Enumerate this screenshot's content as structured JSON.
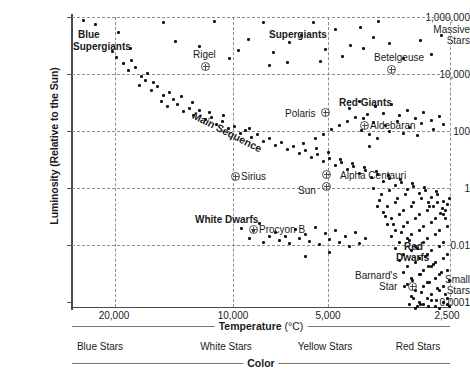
{
  "chart_data": {
    "type": "scatter",
    "xlabel": "Temperature",
    "xunit": "(°C)",
    "ylabel": "Luminosity (Relative to the Sun)",
    "x_axis_reversed": true,
    "x_scale": "log-reversed",
    "y_scale": "log",
    "xlim": [
      30000,
      2300
    ],
    "ylim": [
      0.0001,
      1000000
    ],
    "grid": true,
    "legend": "none",
    "xticks": [
      {
        "label": "20,000",
        "value": 20000
      },
      {
        "label": "10,000",
        "value": 10000
      },
      {
        "label": "5,000",
        "value": 5000
      },
      {
        "label": "2,500",
        "value": 2500
      }
    ],
    "yticks": [
      {
        "label": "1,000,000",
        "value": 1000000
      },
      {
        "label": "10,000",
        "value": 10000
      },
      {
        "label": "100",
        "value": 100
      },
      {
        "label": "1",
        "value": 1
      },
      {
        "label": "0.01",
        "value": 0.01
      },
      {
        "label": "0.0001",
        "value": 0.0001
      }
    ],
    "y_end_notes": [
      {
        "label": "Massive Stars",
        "position": "top"
      },
      {
        "label": "Small Stars",
        "position": "bottom"
      }
    ],
    "color_axis": {
      "title": "Color",
      "categories": [
        "Blue Stars",
        "White Stars",
        "Yellow Stars",
        "Red Stars"
      ]
    },
    "region_labels": [
      {
        "name": "Blue Supergiants",
        "text": "Blue\nSupergiants",
        "bold": true
      },
      {
        "name": "Supergiants",
        "text": "Supergiants",
        "bold": true
      },
      {
        "name": "Red Giants",
        "text": "Red Giants",
        "bold": true
      },
      {
        "name": "Main Sequence",
        "text": "Main Sequence",
        "bold": true,
        "rotated": true
      },
      {
        "name": "White Dwarfs",
        "text": "White Dwarfs",
        "bold": true
      },
      {
        "name": "Red Dwarfs",
        "text": "Red\nDwarfs",
        "bold": true
      }
    ],
    "named_stars": [
      {
        "name": "Rigel",
        "label": "Rigel"
      },
      {
        "name": "Betelgeuse",
        "label": "Betelgeuse"
      },
      {
        "name": "Polaris",
        "label": "Polaris"
      },
      {
        "name": "Aldebaran",
        "label": "Aldebaran"
      },
      {
        "name": "Sirius",
        "label": "Sirius"
      },
      {
        "name": "Alpha Centauri",
        "label": "Alpha Centauri"
      },
      {
        "name": "Sun",
        "label": "Sun"
      },
      {
        "name": "Procyon B",
        "label": "Procyon B"
      },
      {
        "name": "Barnard's Star",
        "label": "Barnard's\nStar"
      }
    ]
  },
  "axes": {
    "y_title": "Luminosity (Relative to the Sun)",
    "y_ticks": [
      {
        "text": "1,000,000",
        "top": 12
      },
      {
        "text": "Massive",
        "top": 24
      },
      {
        "text": "Stars",
        "top": 35
      },
      {
        "text": "10,000",
        "top": 69
      },
      {
        "text": "100",
        "top": 126
      },
      {
        "text": "1",
        "top": 183
      },
      {
        "text": "0.01",
        "top": 240
      },
      {
        "text": "Small",
        "top": 274
      },
      {
        "text": "Stars",
        "top": 285
      },
      {
        "text": "0.0001",
        "top": 297
      }
    ],
    "x_ticks": [
      {
        "text": "20,000",
        "x": 114
      },
      {
        "text": "10,000",
        "x": 233
      },
      {
        "text": "5,000",
        "x": 328
      },
      {
        "text": "2,500",
        "x": 447
      }
    ],
    "x_title_main": "Temperature",
    "x_title_unit": "(°C)",
    "color_title": "Color",
    "color_cats": [
      {
        "text": "Blue Stars",
        "x": 100
      },
      {
        "text": "White Stars",
        "x": 226
      },
      {
        "text": "Yellow Stars",
        "x": 325
      },
      {
        "text": "Red Stars",
        "x": 418
      }
    ]
  },
  "regions": {
    "blue_supergiants": "Blue",
    "blue_supergiants2": "Supergiants",
    "supergiants": "Supergiants",
    "red_giants": "Red Giants",
    "main_sequence": "Main Sequence",
    "white_dwarfs": "White Dwarfs",
    "red_dwarfs": "Red",
    "red_dwarfs2": "Dwarfs"
  },
  "stars": {
    "rigel": "Rigel",
    "betelgeuse": "Betelgeuse",
    "polaris": "Polaris",
    "aldebaran": "Aldebaran",
    "sirius": "Sirius",
    "alpha_centauri": "Alpha Centauri",
    "sun": "Sun",
    "procyon_b": "Procyon B",
    "barnards": "Barnard's",
    "barnards2": "Star"
  },
  "grid": {
    "v": [
      43,
      161,
      256,
      378
    ],
    "h": [
      0,
      57,
      114,
      171,
      228
    ]
  },
  "points": [
    [
      10,
      2
    ],
    [
      22,
      6
    ],
    [
      39,
      33
    ],
    [
      45,
      14
    ],
    [
      57,
      30
    ],
    [
      90,
      4
    ],
    [
      102,
      23
    ],
    [
      126,
      28
    ],
    [
      141,
      3
    ],
    [
      156,
      40
    ],
    [
      165,
      32
    ],
    [
      175,
      21
    ],
    [
      190,
      4
    ],
    [
      200,
      34
    ],
    [
      216,
      24
    ],
    [
      228,
      17
    ],
    [
      240,
      4
    ],
    [
      252,
      31
    ],
    [
      262,
      11
    ],
    [
      277,
      27
    ],
    [
      290,
      30
    ],
    [
      300,
      19
    ],
    [
      316,
      25
    ],
    [
      330,
      40
    ],
    [
      347,
      22
    ],
    [
      358,
      36
    ],
    [
      368,
      17
    ],
    [
      305,
      3
    ],
    [
      287,
      9
    ],
    [
      269,
      38
    ],
    [
      247,
      43
    ],
    [
      214,
      44
    ],
    [
      196,
      47
    ],
    [
      43,
      39
    ],
    [
      50,
      45
    ],
    [
      55,
      52
    ],
    [
      62,
      49
    ],
    [
      68,
      58
    ],
    [
      74,
      55
    ],
    [
      80,
      64
    ],
    [
      58,
      42
    ],
    [
      66,
      67
    ],
    [
      72,
      62
    ],
    [
      78,
      72
    ],
    [
      84,
      68
    ],
    [
      90,
      77
    ],
    [
      96,
      74
    ],
    [
      88,
      83
    ],
    [
      94,
      88
    ],
    [
      100,
      81
    ],
    [
      104,
      86
    ],
    [
      110,
      93
    ],
    [
      116,
      90
    ],
    [
      108,
      78
    ],
    [
      120,
      97
    ],
    [
      126,
      92
    ],
    [
      132,
      101
    ],
    [
      119,
      84
    ],
    [
      138,
      99
    ],
    [
      143,
      106
    ],
    [
      149,
      103
    ],
    [
      155,
      110
    ],
    [
      136,
      94
    ],
    [
      161,
      108
    ],
    [
      150,
      97
    ],
    [
      167,
      115
    ],
    [
      172,
      112
    ],
    [
      178,
      119
    ],
    [
      184,
      116
    ],
    [
      190,
      123
    ],
    [
      196,
      120
    ],
    [
      202,
      127
    ],
    [
      176,
      110
    ],
    [
      208,
      124
    ],
    [
      214,
      131
    ],
    [
      220,
      128
    ],
    [
      226,
      135
    ],
    [
      232,
      132
    ],
    [
      238,
      139
    ],
    [
      244,
      136
    ],
    [
      250,
      143
    ],
    [
      256,
      140
    ],
    [
      262,
      147
    ],
    [
      268,
      144
    ],
    [
      274,
      151
    ],
    [
      280,
      148
    ],
    [
      286,
      155
    ],
    [
      292,
      152
    ],
    [
      298,
      159
    ],
    [
      304,
      156
    ],
    [
      310,
      163
    ],
    [
      316,
      160
    ],
    [
      322,
      167
    ],
    [
      328,
      164
    ],
    [
      334,
      171
    ],
    [
      340,
      168
    ],
    [
      346,
      175
    ],
    [
      352,
      172
    ],
    [
      358,
      179
    ],
    [
      364,
      176
    ],
    [
      370,
      183
    ],
    [
      376,
      180
    ],
    [
      230,
      125
    ],
    [
      243,
      130
    ],
    [
      255,
      134
    ],
    [
      267,
      141
    ],
    [
      279,
      145
    ],
    [
      291,
      149
    ],
    [
      303,
      153
    ],
    [
      315,
      157
    ],
    [
      327,
      161
    ],
    [
      339,
      165
    ],
    [
      351,
      169
    ],
    [
      363,
      173
    ],
    [
      369,
      190
    ],
    [
      374,
      186
    ],
    [
      367,
      195
    ],
    [
      372,
      200
    ],
    [
      360,
      188
    ],
    [
      355,
      184
    ],
    [
      640,
      90
    ],
    [
      276,
      90
    ],
    [
      286,
      83
    ],
    [
      294,
      96
    ],
    [
      302,
      88
    ],
    [
      310,
      95
    ],
    [
      318,
      86
    ],
    [
      326,
      97
    ],
    [
      334,
      92
    ],
    [
      342,
      100
    ],
    [
      350,
      94
    ],
    [
      358,
      102
    ],
    [
      366,
      98
    ],
    [
      300,
      104
    ],
    [
      312,
      107
    ],
    [
      324,
      103
    ],
    [
      336,
      109
    ],
    [
      348,
      105
    ],
    [
      360,
      111
    ],
    [
      370,
      106
    ],
    [
      290,
      100
    ],
    [
      282,
      99
    ],
    [
      274,
      103
    ],
    [
      266,
      107
    ],
    [
      258,
      111
    ],
    [
      250,
      116
    ],
    [
      242,
      120
    ],
    [
      296,
      116
    ],
    [
      304,
      120
    ],
    [
      288,
      112
    ],
    [
      316,
      113
    ],
    [
      330,
      115
    ],
    [
      344,
      117
    ],
    [
      296,
      128
    ],
    [
      186,
      205
    ],
    [
      202,
      214
    ],
    [
      212,
      218
    ],
    [
      222,
      211
    ],
    [
      232,
      216
    ],
    [
      242,
      209
    ],
    [
      252,
      215
    ],
    [
      262,
      212
    ],
    [
      272,
      218
    ],
    [
      282,
      214
    ],
    [
      292,
      220
    ],
    [
      206,
      222
    ],
    [
      216,
      225
    ],
    [
      226,
      220
    ],
    [
      236,
      223
    ],
    [
      246,
      226
    ],
    [
      256,
      221
    ],
    [
      266,
      224
    ],
    [
      276,
      228
    ],
    [
      286,
      225
    ],
    [
      196,
      218
    ],
    [
      190,
      224
    ],
    [
      180,
      212
    ],
    [
      168,
      210
    ],
    [
      176,
      220
    ],
    [
      256,
      234
    ],
    [
      232,
      238
    ],
    [
      300,
      170
    ],
    [
      308,
      176
    ],
    [
      316,
      172
    ],
    [
      324,
      180
    ],
    [
      332,
      176
    ],
    [
      340,
      184
    ],
    [
      348,
      180
    ],
    [
      356,
      188
    ],
    [
      364,
      184
    ],
    [
      372,
      192
    ],
    [
      306,
      182
    ],
    [
      314,
      188
    ],
    [
      322,
      184
    ],
    [
      330,
      192
    ],
    [
      338,
      188
    ],
    [
      346,
      196
    ],
    [
      354,
      192
    ],
    [
      362,
      200
    ],
    [
      370,
      196
    ],
    [
      310,
      194
    ],
    [
      318,
      200
    ],
    [
      326,
      196
    ],
    [
      334,
      204
    ],
    [
      342,
      200
    ],
    [
      350,
      208
    ],
    [
      358,
      204
    ],
    [
      366,
      212
    ],
    [
      374,
      208
    ],
    [
      314,
      206
    ],
    [
      322,
      212
    ],
    [
      330,
      208
    ],
    [
      338,
      216
    ],
    [
      346,
      212
    ],
    [
      354,
      220
    ],
    [
      362,
      216
    ],
    [
      370,
      224
    ],
    [
      318,
      218
    ],
    [
      326,
      224
    ],
    [
      334,
      220
    ],
    [
      342,
      228
    ],
    [
      350,
      224
    ],
    [
      358,
      232
    ],
    [
      366,
      228
    ],
    [
      374,
      236
    ],
    [
      322,
      230
    ],
    [
      330,
      236
    ],
    [
      338,
      232
    ],
    [
      346,
      240
    ],
    [
      354,
      236
    ],
    [
      362,
      244
    ],
    [
      370,
      240
    ],
    [
      326,
      242
    ],
    [
      334,
      248
    ],
    [
      342,
      244
    ],
    [
      350,
      252
    ],
    [
      358,
      248
    ],
    [
      366,
      256
    ],
    [
      374,
      252
    ],
    [
      330,
      254
    ],
    [
      338,
      260
    ],
    [
      346,
      256
    ],
    [
      354,
      264
    ],
    [
      362,
      260
    ],
    [
      370,
      268
    ],
    [
      334,
      266
    ],
    [
      342,
      272
    ],
    [
      350,
      268
    ],
    [
      358,
      276
    ],
    [
      366,
      272
    ],
    [
      374,
      280
    ],
    [
      338,
      278
    ],
    [
      346,
      284
    ],
    [
      354,
      280
    ],
    [
      362,
      288
    ],
    [
      370,
      284
    ],
    [
      342,
      290
    ],
    [
      350,
      286
    ],
    [
      358,
      282
    ],
    [
      366,
      290
    ],
    [
      374,
      286
    ],
    [
      304,
      188
    ],
    [
      312,
      198
    ],
    [
      320,
      206
    ],
    [
      328,
      214
    ],
    [
      336,
      222
    ],
    [
      344,
      230
    ],
    [
      352,
      238
    ],
    [
      360,
      246
    ],
    [
      368,
      254
    ],
    [
      376,
      262
    ],
    [
      355,
      248
    ],
    [
      347,
      256
    ],
    [
      339,
      262
    ],
    [
      331,
      268
    ],
    [
      356,
      264
    ],
    [
      364,
      270
    ],
    [
      372,
      276
    ],
    [
      348,
      274
    ],
    [
      340,
      280
    ],
    [
      363,
      282
    ],
    [
      355,
      288
    ],
    [
      347,
      286
    ],
    [
      368,
      292
    ],
    [
      376,
      288
    ],
    [
      360,
      294
    ],
    [
      352,
      292
    ],
    [
      344,
      288
    ],
    [
      336,
      286
    ]
  ]
}
